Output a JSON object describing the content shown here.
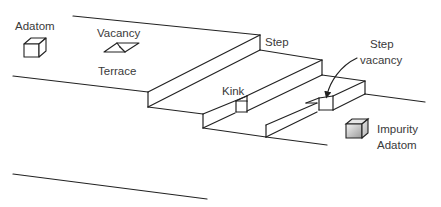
{
  "diagram": {
    "type": "surface-defects-schematic",
    "labels": {
      "adatom": "Adatom",
      "vacancy": "Vacancy",
      "terrace": "Terrace",
      "step": "Step",
      "kink": "Kink",
      "step_vacancy_line1": "Step",
      "step_vacancy_line2": "vacancy",
      "impurity_line1": "Impurity",
      "impurity_line2": "Adatom"
    },
    "colors": {
      "line": "#222222",
      "text": "#3a3a3a",
      "impurity_fill_light": "#f2f2f2",
      "impurity_fill_dark": "#9a9a9a"
    }
  }
}
